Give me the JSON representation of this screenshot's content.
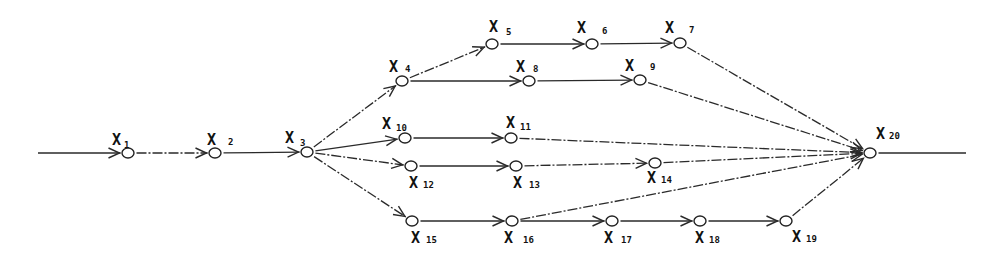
{
  "diagram": {
    "type": "network-graph",
    "nodes": [
      {
        "id": "X1",
        "label": "X",
        "sub": "1",
        "x": 128,
        "y": 153,
        "lx": 112,
        "ly": 145,
        "sx": 124,
        "sy": 148
      },
      {
        "id": "X2",
        "label": "X",
        "sub": "2",
        "x": 215,
        "y": 153,
        "lx": 207,
        "ly": 145,
        "sx": 228,
        "sy": 145
      },
      {
        "id": "X3",
        "label": "X",
        "sub": "3",
        "x": 307,
        "y": 152,
        "lx": 285,
        "ly": 143,
        "sx": 300,
        "sy": 146
      },
      {
        "id": "X4",
        "label": "X",
        "sub": "4",
        "x": 402,
        "y": 81,
        "lx": 389,
        "ly": 72,
        "sx": 405,
        "sy": 72
      },
      {
        "id": "X5",
        "label": "X",
        "sub": "5",
        "x": 492,
        "y": 44,
        "lx": 489,
        "ly": 32,
        "sx": 506,
        "sy": 35
      },
      {
        "id": "X6",
        "label": "X",
        "sub": "6",
        "x": 592,
        "y": 44,
        "lx": 577,
        "ly": 33,
        "sx": 602,
        "sy": 34
      },
      {
        "id": "X7",
        "label": "X",
        "sub": "7",
        "x": 680,
        "y": 43,
        "lx": 665,
        "ly": 33,
        "sx": 689,
        "sy": 33
      },
      {
        "id": "X8",
        "label": "X",
        "sub": "8",
        "x": 529,
        "y": 81,
        "lx": 516,
        "ly": 72,
        "sx": 533,
        "sy": 72
      },
      {
        "id": "X9",
        "label": "X",
        "sub": "9",
        "x": 640,
        "y": 80,
        "lx": 625,
        "ly": 71,
        "sx": 650,
        "sy": 70
      },
      {
        "id": "X10",
        "label": "X",
        "sub": "10",
        "x": 405,
        "y": 138,
        "lx": 382,
        "ly": 129,
        "sx": 396,
        "sy": 131
      },
      {
        "id": "X11",
        "label": "X",
        "sub": "11",
        "x": 511,
        "y": 138,
        "lx": 506,
        "ly": 128,
        "sx": 520,
        "sy": 130
      },
      {
        "id": "X12",
        "label": "X",
        "sub": "12",
        "x": 411,
        "y": 166,
        "lx": 409,
        "ly": 188,
        "sx": 423,
        "sy": 188
      },
      {
        "id": "X13",
        "label": "X",
        "sub": "13",
        "x": 516,
        "y": 166,
        "lx": 513,
        "ly": 188,
        "sx": 529,
        "sy": 188
      },
      {
        "id": "X14",
        "label": "X",
        "sub": "14",
        "x": 655,
        "y": 163,
        "lx": 647,
        "ly": 183,
        "sx": 661,
        "sy": 183
      },
      {
        "id": "X15",
        "label": "X",
        "sub": "15",
        "x": 412,
        "y": 221,
        "lx": 411,
        "ly": 243,
        "sx": 426,
        "sy": 243
      },
      {
        "id": "X16",
        "label": "X",
        "sub": "16",
        "x": 512,
        "y": 221,
        "lx": 504,
        "ly": 243,
        "sx": 523,
        "sy": 243
      },
      {
        "id": "X17",
        "label": "X",
        "sub": "17",
        "x": 612,
        "y": 221,
        "lx": 604,
        "ly": 243,
        "sx": 621,
        "sy": 243
      },
      {
        "id": "X18",
        "label": "X",
        "sub": "18",
        "x": 700,
        "y": 221,
        "lx": 695,
        "ly": 243,
        "sx": 709,
        "sy": 243
      },
      {
        "id": "X19",
        "label": "X",
        "sub": "19",
        "x": 786,
        "y": 221,
        "lx": 792,
        "ly": 242,
        "sx": 806,
        "sy": 242
      },
      {
        "id": "X20",
        "label": "X",
        "sub": "20",
        "x": 870,
        "y": 153,
        "lx": 876,
        "ly": 139,
        "sx": 889,
        "sy": 139
      }
    ],
    "edges": [
      {
        "from": "in",
        "to": "X1",
        "x1": 38,
        "y1": 153,
        "style": "solid"
      },
      {
        "from": "X1",
        "to": "X2",
        "style": "dash"
      },
      {
        "from": "X2",
        "to": "X3",
        "style": "solid"
      },
      {
        "from": "X3",
        "to": "X4",
        "style": "dash"
      },
      {
        "from": "X3",
        "to": "X10",
        "style": "solid"
      },
      {
        "from": "X3",
        "to": "X12",
        "style": "dash"
      },
      {
        "from": "X3",
        "to": "X15",
        "style": "dash"
      },
      {
        "from": "X4",
        "to": "X5",
        "style": "dash"
      },
      {
        "from": "X4",
        "to": "X8",
        "style": "solid"
      },
      {
        "from": "X5",
        "to": "X6",
        "style": "solid"
      },
      {
        "from": "X6",
        "to": "X7",
        "style": "solid"
      },
      {
        "from": "X8",
        "to": "X9",
        "style": "solid"
      },
      {
        "from": "X10",
        "to": "X11",
        "style": "solid"
      },
      {
        "from": "X12",
        "to": "X13",
        "style": "solid"
      },
      {
        "from": "X13",
        "to": "X14",
        "style": "dash"
      },
      {
        "from": "X15",
        "to": "X16",
        "style": "solid"
      },
      {
        "from": "X16",
        "to": "X17",
        "style": "solid"
      },
      {
        "from": "X17",
        "to": "X18",
        "style": "solid"
      },
      {
        "from": "X18",
        "to": "X19",
        "style": "solid"
      },
      {
        "from": "X7",
        "to": "X20",
        "style": "dash"
      },
      {
        "from": "X9",
        "to": "X20",
        "style": "dash"
      },
      {
        "from": "X11",
        "to": "X20",
        "style": "dash"
      },
      {
        "from": "X14",
        "to": "X20",
        "style": "dash"
      },
      {
        "from": "X16",
        "to": "X20",
        "style": "dash"
      },
      {
        "from": "X19",
        "to": "X20",
        "style": "dash"
      },
      {
        "from": "X20",
        "to": "out",
        "x2": 966,
        "y2": 153,
        "style": "solid"
      }
    ]
  }
}
